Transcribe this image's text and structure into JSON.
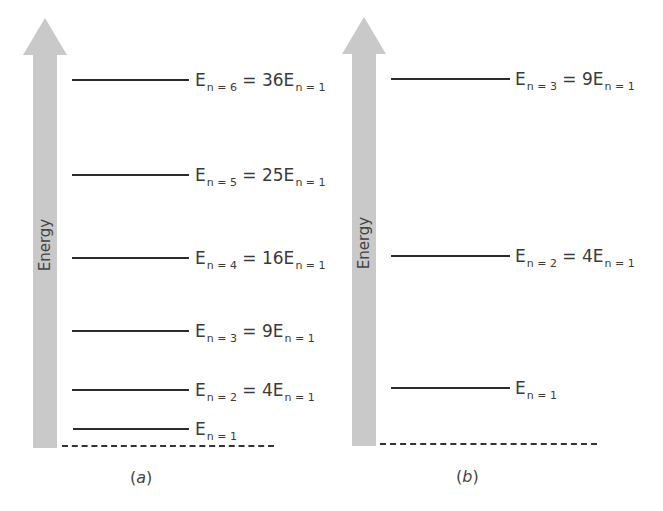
{
  "axis_label": "Energy",
  "panels": [
    {
      "caption": "a",
      "levels": [
        {
          "n": 6,
          "main": "E",
          "sub": "n = 6",
          "eq": " = 36E",
          "sub2": "n = 1",
          "multiple": 36
        },
        {
          "n": 5,
          "main": "E",
          "sub": "n = 5",
          "eq": " = 25E",
          "sub2": "n = 1",
          "multiple": 25
        },
        {
          "n": 4,
          "main": "E",
          "sub": "n = 4",
          "eq": " = 16E",
          "sub2": "n = 1",
          "multiple": 16
        },
        {
          "n": 3,
          "main": "E",
          "sub": "n = 3",
          "eq": " = 9E",
          "sub2": "n = 1",
          "multiple": 9
        },
        {
          "n": 2,
          "main": "E",
          "sub": "n = 2",
          "eq": " = 4E",
          "sub2": "n = 1",
          "multiple": 4
        },
        {
          "n": 1,
          "main": "E",
          "sub": "n = 1",
          "eq": "",
          "sub2": "",
          "multiple": 1
        }
      ]
    },
    {
      "caption": "b",
      "levels": [
        {
          "n": 3,
          "main": "E",
          "sub": "n = 3",
          "eq": " = 9E",
          "sub2": "n = 1",
          "multiple": 9
        },
        {
          "n": 2,
          "main": "E",
          "sub": "n = 2",
          "eq": " = 4E",
          "sub2": "n = 1",
          "multiple": 4
        },
        {
          "n": 1,
          "main": "E",
          "sub": "n = 1",
          "eq": "",
          "sub2": "",
          "multiple": 1
        }
      ]
    }
  ],
  "colors": {
    "arrow": "#c9c9c9",
    "line": "#2b2b2b",
    "text": "#3a3a3a"
  }
}
